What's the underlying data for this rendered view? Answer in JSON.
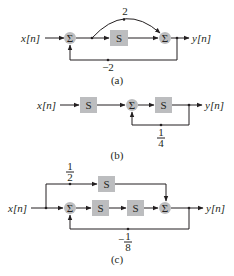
{
  "figure": {
    "diagrams": [
      {
        "id": "a",
        "caption": "(a)",
        "input_label": "x[n]",
        "output_label": "y[n]",
        "sum_symbol": "Σ",
        "blocks": [
          "S"
        ],
        "feedforward_gain": "2",
        "feedback_gain": "−2"
      },
      {
        "id": "b",
        "caption": "(b)",
        "input_label": "x[n]",
        "output_label": "y[n]",
        "sum_symbol": "Σ",
        "blocks": [
          "S",
          "S"
        ],
        "feedback_gain_num": "1",
        "feedback_gain_den": "4"
      },
      {
        "id": "c",
        "caption": "(c)",
        "input_label": "x[n]",
        "output_label": "y[n]",
        "sum_symbol": "Σ",
        "blocks": [
          "S",
          "S",
          "S"
        ],
        "feedforward_gain_num": "1",
        "feedforward_gain_den": "2",
        "feedback_gain_sign": "−",
        "feedback_gain_num": "1",
        "feedback_gain_den": "8"
      }
    ],
    "colors": {
      "block_fill": "#bcbdbf",
      "line": "#231f20"
    }
  }
}
